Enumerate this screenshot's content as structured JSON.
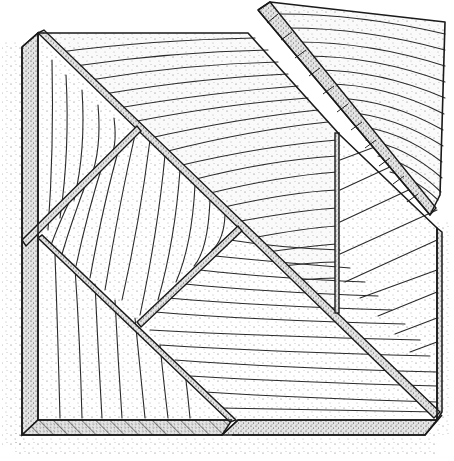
{
  "illustration": {
    "subject": "stippled pen drawing of a wooden tangram-style puzzle board with one piece lifted",
    "colors": {
      "background": "#ffffff",
      "ink": "#1a1a1a",
      "wood_face": "#f4f4f4",
      "bevel_shade": "#d6d6d6",
      "seam_shade": "#bdbdbd"
    },
    "pieces": [
      {
        "name": "large-top-triangle",
        "grain": "horizontal"
      },
      {
        "name": "left-tall-triangle",
        "grain": "vertical"
      },
      {
        "name": "center-square",
        "grain": "vertical"
      },
      {
        "name": "lower-triangle",
        "grain": "horizontal"
      },
      {
        "name": "right-triangle",
        "grain": "diagonal"
      },
      {
        "name": "bottom-left-triangle",
        "grain": "vertical"
      },
      {
        "name": "lifted-parallelogram",
        "grain": "horizontal"
      }
    ]
  }
}
